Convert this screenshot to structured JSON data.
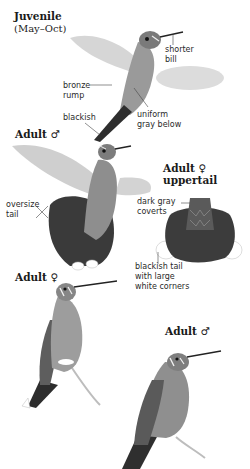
{
  "figures": [
    {
      "id": "juvenile",
      "title": "Juvenile",
      "subtitle": "(May–Oct)",
      "labels": [
        {
          "id": "shorter-bill",
          "line1": "shorter",
          "line2": "bill"
        },
        {
          "id": "bronze-rump",
          "line1": "bronze",
          "line2": "rump"
        },
        {
          "id": "blackish",
          "line1": "blackish",
          "line2": ""
        },
        {
          "id": "uniform-gray-below",
          "line1": "uniform",
          "line2": "gray below"
        }
      ]
    },
    {
      "id": "adult-male-flying",
      "title": "Adult ♂",
      "labels": [
        {
          "id": "oversize-tail",
          "line1": "oversize",
          "line2": "tail"
        }
      ]
    },
    {
      "id": "adult-female-uppertail",
      "title": "Adult ♀",
      "subtitle": "uppertail",
      "labels": [
        {
          "id": "dark-gray-coverts",
          "line1": "dark gray",
          "line2": "coverts"
        },
        {
          "id": "blackish-tail",
          "line1": "blackish tail",
          "line2": "with large",
          "line3": "white corners"
        }
      ]
    },
    {
      "id": "adult-female-perched",
      "title": "Adult ♀"
    },
    {
      "id": "adult-male-perched",
      "title": "Adult ♂"
    }
  ],
  "colors": {
    "background": "#ffffff",
    "text": "#1a1a1a",
    "bird_gray": "#8c8c8c",
    "dark_tail": "#3a3a3a",
    "wing": "#c8c8c8"
  }
}
